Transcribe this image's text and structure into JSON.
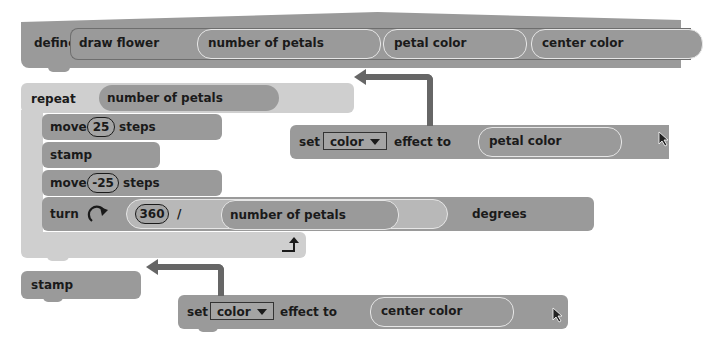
{
  "define_block": {
    "keyword": "define",
    "name": "draw flower",
    "params": [
      "number of petals",
      "petal color",
      "center color"
    ]
  },
  "repeat_block": {
    "keyword": "repeat",
    "count_reporter": "number of petals",
    "loop_icon": "loop-arrow-icon"
  },
  "inner_blocks": {
    "move1": {
      "verb": "move",
      "value": "25",
      "suffix": "steps"
    },
    "stamp1": {
      "label": "stamp"
    },
    "move2": {
      "verb": "move",
      "value": "-25",
      "suffix": "steps"
    },
    "turn": {
      "verb": "turn",
      "icon": "rotate-clockwise-icon",
      "dividend": "360",
      "operator": "/",
      "divisor": "number of petals",
      "suffix": "degrees"
    }
  },
  "after_blocks": {
    "stamp2": {
      "label": "stamp"
    }
  },
  "floating_blocks": {
    "set_petal": {
      "verb": "set",
      "effect": "color",
      "middle": "effect to",
      "value": "petal color"
    },
    "set_center": {
      "verb": "set",
      "effect": "color",
      "middle": "effect to",
      "value": "center color"
    }
  },
  "colors": {
    "block": "#9a9a9a",
    "c_block": "#cfcfcf",
    "arrow": "#666666",
    "text": "#1a1a1a"
  }
}
